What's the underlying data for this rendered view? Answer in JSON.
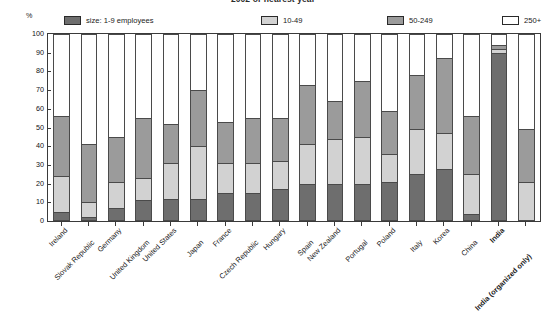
{
  "chart_data": {
    "type": "bar",
    "subtype": "stacked-bar-percent",
    "title": "2002 or nearest year",
    "xlabel": "",
    "ylabel": "%",
    "ylim": [
      0,
      100
    ],
    "yticks": [
      0,
      10,
      20,
      30,
      40,
      50,
      60,
      70,
      80,
      90,
      100
    ],
    "grid": false,
    "legend_position": "top",
    "categories": [
      "Ireland",
      "Slovak Republic",
      "Germany",
      "United Kingdom",
      "United States",
      "Japan",
      "France",
      "Czech Republic",
      "Hungary",
      "Spain",
      "New Zealand",
      "Portugal",
      "Poland",
      "Italy",
      "Korea",
      "China",
      "India",
      "India (organized only)"
    ],
    "emphasized_categories": [
      "India",
      "India (organized only)"
    ],
    "series": [
      {
        "name": "size: 1-9 employees",
        "color": "#6e6e6e",
        "values": [
          5,
          2,
          7,
          11,
          12,
          12,
          15,
          15,
          17,
          20,
          20,
          20,
          21,
          25,
          28,
          4,
          90,
          0
        ]
      },
      {
        "name": "10-49",
        "color": "#d2d2d2",
        "values": [
          19,
          8,
          14,
          12,
          19,
          28,
          16,
          16,
          15,
          21,
          24,
          25,
          15,
          24,
          19,
          21,
          2,
          21
        ]
      },
      {
        "name": "50-249",
        "color": "#9b9b9b",
        "values": [
          32,
          31,
          24,
          32,
          21,
          30,
          22,
          24,
          23,
          32,
          20,
          30,
          23,
          29,
          40,
          31,
          2,
          28
        ]
      },
      {
        "name": "250+",
        "color": "#ffffff",
        "values": [
          44,
          59,
          55,
          45,
          48,
          30,
          47,
          45,
          45,
          27,
          36,
          25,
          41,
          22,
          13,
          44,
          6,
          51
        ]
      }
    ]
  },
  "legend": {
    "items": [
      {
        "label": "size: 1-9 employees",
        "color": "#6e6e6e"
      },
      {
        "label": "10-49",
        "color": "#d2d2d2"
      },
      {
        "label": "50-249",
        "color": "#9b9b9b"
      },
      {
        "label": "250+",
        "color": "#ffffff"
      }
    ]
  },
  "axis": {
    "unit_label": "%"
  }
}
